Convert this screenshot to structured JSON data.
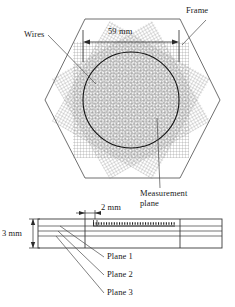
{
  "figure": {
    "name": "wire-mesh-frame-diagram",
    "colors": {
      "line": "#3a3a3a",
      "mesh": "#8a8a8a",
      "circle": "#111111",
      "text": "#1a1a1a",
      "background": "#ffffff"
    }
  },
  "top_view": {
    "name": "hexagonal-frame-top-view",
    "frame_label": "Frame",
    "wires_label": "Wires",
    "diameter_label": "59 mm",
    "measurement_plane_label": "Measurement plane",
    "measurement_plane_line1": "Measurement",
    "measurement_plane_line2": "plane",
    "shape": "hexagon",
    "mesh_layers": 3,
    "mesh_rotations_deg": [
      0,
      60,
      120
    ],
    "circle_diameter_mm": 59
  },
  "side_view": {
    "name": "plate-cross-section-side-view",
    "thickness_label": "3 mm",
    "spacing_label": "2 mm",
    "thickness_mm": 3,
    "spacing_mm": 2,
    "planes": [
      {
        "label": "Plane 1"
      },
      {
        "label": "Plane 2"
      },
      {
        "label": "Plane 3"
      }
    ]
  }
}
